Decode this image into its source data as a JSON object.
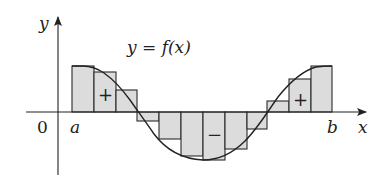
{
  "figure": {
    "labels": {
      "y_axis": "y",
      "x_axis": "x",
      "origin": "0",
      "a": "a",
      "b": "b",
      "function": "y = f(x)",
      "positive_left": "+",
      "negative_middle": "−",
      "positive_right": "+"
    },
    "colors": {
      "fill": "#dcdcdc",
      "stroke": "#2a2a2a",
      "axis": "#222222",
      "background": "#ffffff"
    },
    "axes": {
      "origin_px": [
        58,
        112
      ],
      "x_axis": {
        "x_start": 26,
        "x_end": 366,
        "y": 112
      },
      "y_axis": {
        "x": 58,
        "y_top": 17,
        "y_bottom": 175
      }
    },
    "rectangles": [
      {
        "x": 72,
        "width": 22,
        "top": 66,
        "bottom": 112,
        "sign": "+"
      },
      {
        "x": 94,
        "width": 22,
        "top": 72,
        "bottom": 112,
        "sign": "+"
      },
      {
        "x": 116,
        "width": 21,
        "top": 90,
        "bottom": 112,
        "sign": "+"
      },
      {
        "x": 137,
        "width": 22,
        "top": 112,
        "bottom": 121,
        "sign": "-"
      },
      {
        "x": 159,
        "width": 22,
        "top": 112,
        "bottom": 139,
        "sign": "-"
      },
      {
        "x": 181,
        "width": 22,
        "top": 112,
        "bottom": 156,
        "sign": "-"
      },
      {
        "x": 203,
        "width": 22,
        "top": 112,
        "bottom": 160,
        "sign": "-"
      },
      {
        "x": 225,
        "width": 22,
        "top": 112,
        "bottom": 149,
        "sign": "-"
      },
      {
        "x": 247,
        "width": 20,
        "top": 112,
        "bottom": 129,
        "sign": "-"
      },
      {
        "x": 267,
        "width": 22,
        "top": 101,
        "bottom": 112,
        "sign": "+"
      },
      {
        "x": 289,
        "width": 22,
        "top": 79,
        "bottom": 112,
        "sign": "+"
      },
      {
        "x": 311,
        "width": 21,
        "top": 66,
        "bottom": 112,
        "sign": "+"
      }
    ]
  },
  "chart_data": {
    "type": "area",
    "title": "y = f(x)",
    "xlabel": "x",
    "ylabel": "y",
    "x_tick_labels": [
      "0",
      "a",
      "b"
    ],
    "n_subintervals": 12,
    "rectangle_signs": [
      "+",
      "+",
      "+",
      "-",
      "-",
      "-",
      "-",
      "-",
      "-",
      "+",
      "+",
      "+"
    ],
    "relative_heights": [
      1.0,
      0.87,
      0.48,
      -0.2,
      -0.59,
      -0.96,
      -1.04,
      -0.8,
      -0.37,
      0.24,
      0.72,
      1.0
    ],
    "region_labels": [
      "+",
      "−",
      "+"
    ],
    "grid": false,
    "legend": false
  }
}
